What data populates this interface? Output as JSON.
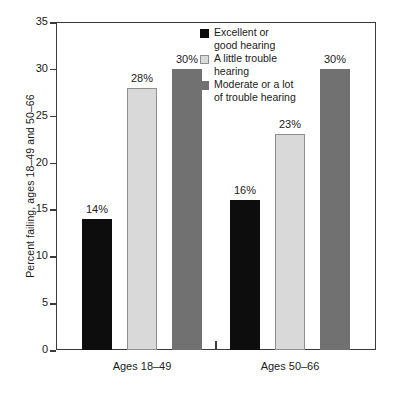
{
  "chart_data": {
    "type": "bar",
    "title": "",
    "subtitle": "",
    "xlabel": "",
    "ylabel": "Percent failing, ages 18–49 and 50–66",
    "ylim": [
      0,
      35
    ],
    "yticks": [
      0,
      5,
      10,
      15,
      20,
      25,
      30,
      35
    ],
    "ytick_labels": [
      "0",
      "5",
      "10",
      "15",
      "20",
      "25",
      "30",
      "35"
    ],
    "grid": false,
    "legend_position": "top-right-inside",
    "categories": [
      "Ages 18–49",
      "Ages 50–66"
    ],
    "series": [
      {
        "name": "Excellent or good hearing",
        "color": "#0d0d0d",
        "values": [
          14,
          16
        ],
        "data_labels": [
          "14%",
          "16%"
        ]
      },
      {
        "name": "A little trouble hearing",
        "color": "#d9d9d9",
        "values": [
          28,
          23
        ],
        "data_labels": [
          "28%",
          "23%"
        ]
      },
      {
        "name": "Moderate or a lot of trouble hearing",
        "color": "#717171",
        "values": [
          30,
          30
        ],
        "data_labels": [
          "30%",
          "30%"
        ]
      }
    ],
    "legend_entries": [
      {
        "label_line1": "Excellent or",
        "label_line2": "good hearing",
        "color": "#0d0d0d"
      },
      {
        "label_line1": "A little trouble",
        "label_line2": "hearing",
        "color": "#d9d9d9"
      },
      {
        "label_line1": "Moderate or a lot",
        "label_line2": "of trouble hearing",
        "color": "#717171"
      }
    ],
    "axis_color": "#3a3a3a",
    "background_color": "#ffffff"
  }
}
